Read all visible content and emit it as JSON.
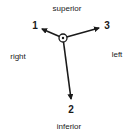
{
  "diagram": {
    "directions": {
      "superior": "superior",
      "inferior": "inferior",
      "right": "right",
      "left": "left"
    },
    "axes": [
      {
        "id": "1",
        "label": "1"
      },
      {
        "id": "2",
        "label": "2"
      },
      {
        "id": "3",
        "label": "3"
      }
    ],
    "colors": {
      "stroke": "#1a1a1a",
      "background": "#ffffff"
    }
  }
}
